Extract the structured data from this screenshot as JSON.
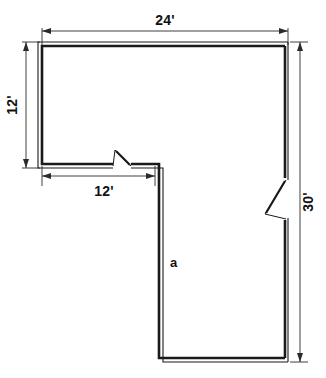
{
  "diagram": {
    "type": "floor-plan",
    "background_color": "#ffffff",
    "line_color": "#1a1a1a",
    "dimension_color": "#2b2b2b"
  },
  "dimensions": [
    {
      "id": "top-width",
      "label": "24'",
      "value": 24,
      "unit": "feet",
      "orientation": "horizontal",
      "placement": "top",
      "measures": "overall width of upper section"
    },
    {
      "id": "left-height",
      "label": "12'",
      "value": 12,
      "unit": "feet",
      "orientation": "vertical",
      "placement": "left",
      "measures": "height of upper-left section"
    },
    {
      "id": "bottom-left-width",
      "label": "12'",
      "value": 12,
      "unit": "feet",
      "orientation": "horizontal",
      "placement": "below upper-left section",
      "measures": "width of upper-left wing"
    },
    {
      "id": "right-height",
      "label": "30'",
      "value": 30,
      "unit": "feet",
      "orientation": "vertical",
      "placement": "right",
      "measures": "overall height of plan"
    }
  ],
  "labels": [
    {
      "id": "area-label",
      "text": "a",
      "description": "interior wall label for the lower wing"
    }
  ],
  "doors": [
    {
      "id": "door-interior-top",
      "location": "bottom wall of upper-left section",
      "swing": "inward-left"
    },
    {
      "id": "door-exterior-right",
      "location": "right wall mid-height",
      "swing": "inward-left"
    }
  ]
}
